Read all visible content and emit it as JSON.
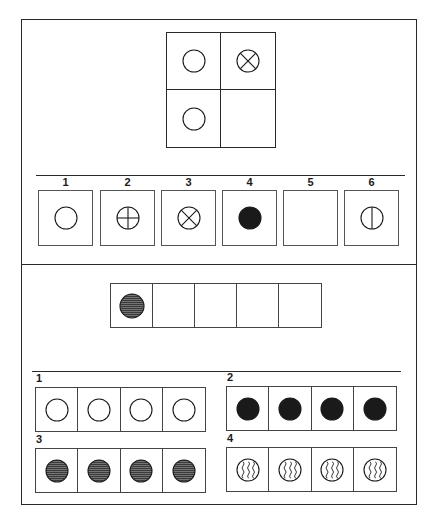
{
  "puzzle_1": {
    "matrix": [
      {
        "symbol": "circle-empty"
      },
      {
        "symbol": "circle-x"
      },
      {
        "symbol": "circle-empty"
      },
      {
        "symbol": "blank"
      }
    ],
    "options": [
      {
        "number": "1",
        "symbol": "circle-empty"
      },
      {
        "number": "2",
        "symbol": "circle-cross"
      },
      {
        "number": "3",
        "symbol": "circle-x"
      },
      {
        "number": "4",
        "symbol": "circle-filled"
      },
      {
        "number": "5",
        "symbol": "blank"
      },
      {
        "number": "6",
        "symbol": "circle-vertical-line"
      }
    ]
  },
  "puzzle_2": {
    "sequence": [
      {
        "symbol": "circle-hatched"
      },
      {
        "symbol": "blank"
      },
      {
        "symbol": "blank"
      },
      {
        "symbol": "blank"
      },
      {
        "symbol": "blank"
      }
    ],
    "options": [
      {
        "number": "1",
        "symbol": "circle-empty",
        "count": 4
      },
      {
        "number": "2",
        "symbol": "circle-filled",
        "count": 4
      },
      {
        "number": "3",
        "symbol": "circle-hatched",
        "count": 4
      },
      {
        "number": "4",
        "symbol": "circle-wavy",
        "count": 4
      }
    ]
  },
  "colors": {
    "ink": "#1a1a1a",
    "hatch": "#3a3a3a",
    "background": "#ffffff"
  }
}
